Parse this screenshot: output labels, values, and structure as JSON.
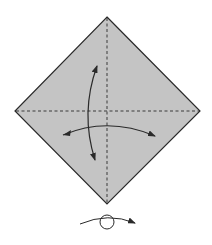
{
  "diagram": {
    "paper_color": "#c4c4c4",
    "line_color": "#2a2a2a",
    "creases": [
      {
        "name": "vertical-valley-fold",
        "style": "dashed"
      },
      {
        "name": "horizontal-valley-fold",
        "style": "dashed"
      }
    ],
    "arrows": [
      {
        "name": "fold-unfold-vertical",
        "meaning": "fold and unfold along horizontal crease"
      },
      {
        "name": "fold-unfold-horizontal",
        "meaning": "fold and unfold along vertical crease"
      }
    ],
    "symbols": [
      {
        "name": "turn-over",
        "meaning": "turn the model over"
      }
    ]
  }
}
